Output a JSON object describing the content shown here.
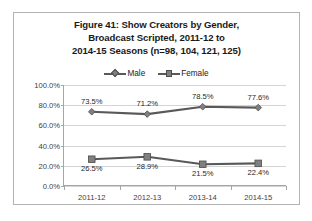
{
  "figure": {
    "title_lines": [
      "Figure 41:  Show Creators by Gender,",
      "Broadcast Scripted, 2011-12 to",
      "2014-15 Seasons (n=98, 104, 121, 125)"
    ]
  },
  "legend": {
    "items": [
      {
        "label": "Male",
        "marker": "diamond-marker-icon",
        "color": "#595959"
      },
      {
        "label": "Female",
        "marker": "square-marker-icon",
        "color": "#595959"
      }
    ]
  },
  "chart_data": {
    "type": "line",
    "title": "Figure 41:  Show Creators by Gender, Broadcast Scripted, 2011-12 to 2014-15 Seasons (n=98, 104, 121, 125)",
    "xlabel": "",
    "ylabel": "",
    "categories": [
      "2011-12",
      "2012-13",
      "2013-14",
      "2014-15"
    ],
    "series": [
      {
        "name": "Male",
        "values": [
          73.5,
          71.2,
          78.5,
          77.6
        ],
        "labels": [
          "73.5%",
          "71.2%",
          "78.5%",
          "77.6%"
        ],
        "label_position": "above",
        "marker": "diamond",
        "color": "#595959"
      },
      {
        "name": "Female",
        "values": [
          26.5,
          28.9,
          21.5,
          22.4
        ],
        "labels": [
          "26.5%",
          "28.9%",
          "21.5%",
          "22.4%"
        ],
        "label_position": "below",
        "marker": "square",
        "color": "#595959"
      }
    ],
    "ylim": [
      0,
      100
    ],
    "ytick_values": [
      0,
      20,
      40,
      60,
      80,
      100
    ],
    "ytick_labels": [
      "0.0%",
      "20.0%",
      "40.0%",
      "60.0%",
      "80.0%",
      "100.0%"
    ],
    "grid": true,
    "grid_axis": "y",
    "grid_color": "#d4d4d4",
    "legend_position": "top-center",
    "sample_sizes": [
      98,
      104,
      121,
      125
    ]
  }
}
